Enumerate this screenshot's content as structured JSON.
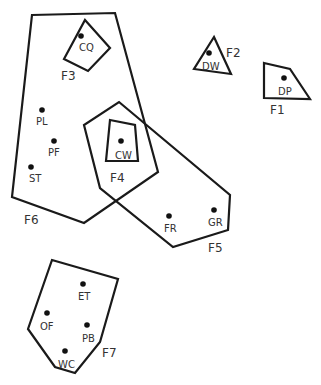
{
  "diagram": {
    "type": "cluster-map",
    "clusters": [
      {
        "id": "F1",
        "label": "F1",
        "members": [
          "DP"
        ]
      },
      {
        "id": "F2",
        "label": "F2",
        "members": [
          "DW"
        ]
      },
      {
        "id": "F3",
        "label": "F3",
        "members": [
          "CQ"
        ]
      },
      {
        "id": "F4",
        "label": "F4",
        "members": [
          "CW"
        ]
      },
      {
        "id": "F5",
        "label": "F5",
        "members": [
          "CW",
          "FR",
          "GR"
        ]
      },
      {
        "id": "F6",
        "label": "F6",
        "members": [
          "CQ",
          "PL",
          "PF",
          "ST",
          "CW"
        ]
      },
      {
        "id": "F7",
        "label": "F7",
        "members": [
          "ET",
          "OF",
          "PB",
          "WC"
        ]
      }
    ],
    "points": [
      {
        "id": "CQ",
        "label": "CQ"
      },
      {
        "id": "DW",
        "label": "DW"
      },
      {
        "id": "DP",
        "label": "DP"
      },
      {
        "id": "PL",
        "label": "PL"
      },
      {
        "id": "PF",
        "label": "PF"
      },
      {
        "id": "ST",
        "label": "ST"
      },
      {
        "id": "CW",
        "label": "CW"
      },
      {
        "id": "FR",
        "label": "FR"
      },
      {
        "id": "GR",
        "label": "GR"
      },
      {
        "id": "ET",
        "label": "ET"
      },
      {
        "id": "OF",
        "label": "OF"
      },
      {
        "id": "PB",
        "label": "PB"
      },
      {
        "id": "WC",
        "label": "WC"
      }
    ]
  }
}
